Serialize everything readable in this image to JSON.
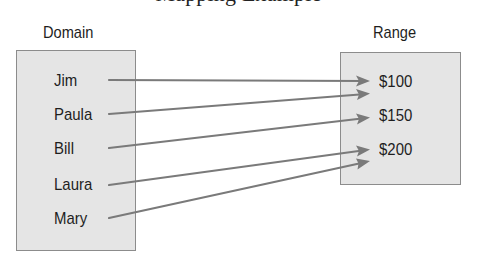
{
  "caption": {
    "text": "Mapping Example",
    "note": "cropped at top; only descenders visible"
  },
  "domain": {
    "label": "Domain",
    "items": [
      "Jim",
      "Paula",
      "Bill",
      "Laura",
      "Mary"
    ]
  },
  "range": {
    "label": "Range",
    "items": [
      "$100",
      "$150",
      "$200"
    ]
  },
  "mappings": [
    {
      "from": "Jim",
      "to": "$100"
    },
    {
      "from": "Paula",
      "to": "$100"
    },
    {
      "from": "Bill",
      "to": "$150"
    },
    {
      "from": "Laura",
      "to": "$200"
    },
    {
      "from": "Mary",
      "to": "$200"
    }
  ],
  "colors": {
    "box_fill": "#e5e5e5",
    "box_border": "#8c8c8c",
    "arrow": "#7a7a7a",
    "text": "#1e1e1e"
  }
}
